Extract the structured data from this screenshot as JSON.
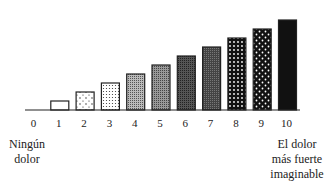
{
  "chart_data": {
    "type": "bar",
    "title": "",
    "xlabel": "",
    "ylabel": "",
    "categories": [
      "0",
      "1",
      "2",
      "3",
      "4",
      "5",
      "6",
      "7",
      "8",
      "9",
      "10"
    ],
    "values": [
      0,
      1,
      2,
      3,
      4,
      5,
      6,
      7,
      8,
      9,
      10
    ],
    "ylim": [
      0,
      10
    ],
    "grid": false,
    "legend": "none",
    "fills": [
      "none",
      "white",
      "sparse-dots",
      "dense-dots",
      "light-stipple",
      "stipple",
      "dark-stipple",
      "darker-stipple",
      "black-white-dots",
      "black-sparse-white-dots",
      "solid-black"
    ],
    "annotations": {
      "left": "Ningún dolor",
      "right": "El dolor más fuerte imaginable"
    }
  },
  "labels": {
    "left_line1": "Ningún",
    "left_line2": "dolor",
    "right_line1": "El dolor",
    "right_line2": "más fuerte",
    "right_line3": "imaginable"
  }
}
